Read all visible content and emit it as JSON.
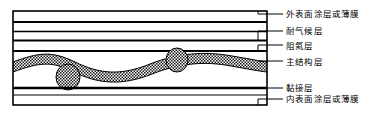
{
  "figure": {
    "type": "cross-section-diagram",
    "background_color": "#ffffff",
    "line_color": "#000000",
    "hatch_color": "#000000",
    "frame": {
      "x": 13,
      "y": 11,
      "width": 254,
      "height": 94
    }
  },
  "layers": [
    {
      "id": "outer-coating",
      "label": "外表面涂层或薄膜",
      "order": 1,
      "label_x": 286,
      "label_y": 9,
      "leader_y": 14,
      "band_top": 11,
      "band_bottom": 22
    },
    {
      "id": "weather-resistant",
      "label": "耐气候层",
      "order": 2,
      "label_x": 286,
      "label_y": 26,
      "leader_y": 31,
      "band_top": 22,
      "band_bottom": 40
    },
    {
      "id": "helium-barrier",
      "label": "阻氦层",
      "order": 3,
      "label_x": 286,
      "label_y": 41,
      "leader_y": 45,
      "band_top": 40,
      "band_bottom": 51
    },
    {
      "id": "main-structural",
      "label": "主结构层",
      "order": 4,
      "label_x": 286,
      "label_y": 57,
      "leader_y": 61,
      "band_top": 51,
      "band_bottom": 88
    },
    {
      "id": "adhesive",
      "label": "黏接层",
      "order": 5,
      "label_x": 286,
      "label_y": 83,
      "leader_y": 88,
      "band_top": 88,
      "band_bottom": 95
    },
    {
      "id": "inner-coating",
      "label": "内表面涂层或薄膜",
      "order": 6,
      "label_x": 286,
      "label_y": 94,
      "leader_y": 99,
      "band_top": 95,
      "band_bottom": 105
    }
  ],
  "structural_detail": {
    "weave_description": "波浪形编织纤维层",
    "yarn_cross_sections": [
      {
        "cx": 68,
        "cy": 77,
        "rx": 12,
        "ry": 13
      },
      {
        "cx": 177,
        "cy": 60,
        "rx": 11,
        "ry": 12
      }
    ],
    "pattern": "checkerboard"
  },
  "leader_lines": {
    "tick_x_start": 256,
    "tick_x_end": 267,
    "dash_x_start": 270,
    "dash_x_end": 283
  }
}
